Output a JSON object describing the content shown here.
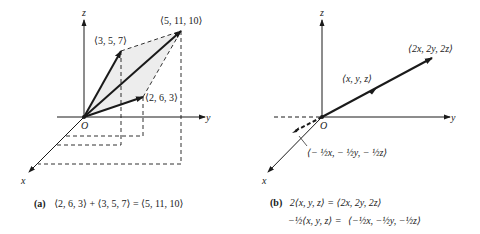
{
  "panel_a": {
    "axis_labels": {
      "x": "x",
      "y": "y",
      "z": "z",
      "origin": "O"
    },
    "points": {
      "u": "⟨3, 5, 7⟩",
      "sum": "⟨5, 11, 10⟩",
      "v": "⟨2, 6, 3⟩"
    },
    "caption_tag": "(a)",
    "caption_text": "⟨2, 6, 3⟩ + ⟨3, 5, 7⟩ = ⟨5, 11, 10⟩"
  },
  "panel_b": {
    "axis_labels": {
      "x": "x",
      "y": "y",
      "z": "z",
      "origin": "O"
    },
    "points": {
      "v": "⟨x, y, z⟩",
      "double": "⟨2x, 2y, 2z⟩",
      "neg_half": "⟨− ½x, − ½y, − ½z⟩"
    },
    "caption_tag": "(b)",
    "caption_line1": "2⟨x, y, z⟩ = ⟨2x, 2y, 2z⟩",
    "caption_line2_lhs": "−½⟨x, y, z⟩ =",
    "caption_line2_rhs": "⟨−½x, −½y, −½z⟩"
  }
}
